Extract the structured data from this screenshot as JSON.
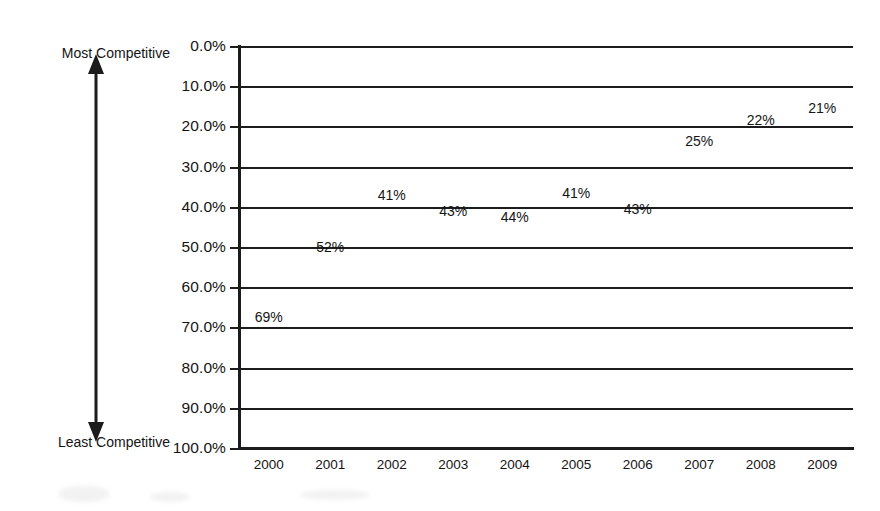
{
  "chart_data": {
    "type": "line",
    "title": "",
    "subtitle": "",
    "xlabel": "",
    "ylabel": "",
    "categories": [
      "2000",
      "2001",
      "2002",
      "2003",
      "2004",
      "2005",
      "2006",
      "2007",
      "2008",
      "2009"
    ],
    "values": [
      69,
      52,
      41,
      43,
      44,
      41,
      43,
      25,
      22,
      21
    ],
    "data_labels": [
      "69%",
      "52%",
      "41%",
      "43%",
      "44%",
      "41%",
      "43%",
      "25%",
      "22%",
      "21%"
    ],
    "ylim": [
      0,
      100
    ],
    "y_inverted": true,
    "y_tick_step": 10,
    "y_tick_labels": [
      "0.0%",
      "10.0%",
      "20.0%",
      "30.0%",
      "40.0%",
      "50.0%",
      "60.0%",
      "70.0%",
      "80.0%",
      "90.0%",
      "100.0%"
    ],
    "y_tick_values": [
      0,
      10,
      20,
      30,
      40,
      50,
      60,
      70,
      80,
      90,
      100
    ],
    "grid": true,
    "grid_axis": "y",
    "legend": false,
    "legend_position": "none",
    "annotations": [
      {
        "name": "most-competitive",
        "text": "Most Competitive",
        "position": "top-left",
        "value": 0
      },
      {
        "name": "least-competitive",
        "text": "Least Competitive",
        "position": "bottom-left",
        "value": 100
      }
    ],
    "series_color": "#1c1c1c",
    "background_color": "#ffffff"
  },
  "axis_annotation": {
    "top_label": "Most Competitive",
    "bottom_label": "Least Competitive",
    "arrow_name": "double-headed-vertical-arrow"
  },
  "colors": {
    "ink": "#1c1c1c",
    "text": "#141414",
    "background": "#ffffff"
  }
}
